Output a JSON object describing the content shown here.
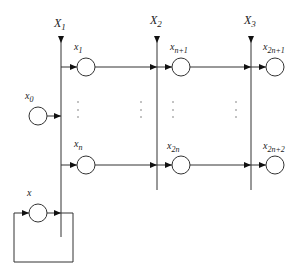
{
  "diagram": {
    "colors": {
      "stroke": "#333333",
      "background": "#ffffff",
      "arrow": "#111111",
      "dots": "#777777"
    },
    "buses": [
      {
        "id": "X1",
        "label": "X",
        "sub": "1",
        "x": 61,
        "y_top": 36,
        "y_bottom": 237
      },
      {
        "id": "X2",
        "label": "X",
        "sub": "2",
        "x": 157,
        "y_top": 36,
        "y_bottom": 190
      },
      {
        "id": "X3",
        "label": "X",
        "sub": "3",
        "x": 251,
        "y_top": 36,
        "y_bottom": 190
      }
    ],
    "nodes": [
      {
        "id": "x1",
        "label": "x",
        "sub": "1",
        "cx": 86,
        "cy": 67
      },
      {
        "id": "xn1",
        "label": "x",
        "sub": "n+1",
        "cx": 181,
        "cy": 67
      },
      {
        "id": "x2n1",
        "label": "x",
        "sub": "2n+1",
        "cx": 275,
        "cy": 67
      },
      {
        "id": "xn",
        "label": "x",
        "sub": "n",
        "cx": 86,
        "cy": 165
      },
      {
        "id": "x2n",
        "label": "x",
        "sub": "2n",
        "cx": 181,
        "cy": 165
      },
      {
        "id": "x2n2",
        "label": "x",
        "sub": "2n+2",
        "cx": 275,
        "cy": 165
      },
      {
        "id": "x0",
        "label": "x",
        "sub": "0",
        "cx": 37,
        "cy": 116
      },
      {
        "id": "x",
        "label": "x",
        "sub": "",
        "cx": 37,
        "cy": 213
      }
    ],
    "labels": {
      "X1": "X",
      "X1_sub": "1",
      "X2": "X",
      "X2_sub": "2",
      "X3": "X",
      "X3_sub": "3",
      "x1": "x",
      "x1_sub": "1",
      "xn1": "x",
      "xn1_sub": "n+1",
      "x2n1": "x",
      "x2n1_sub": "2n+1",
      "xn": "x",
      "xn_sub": "n",
      "x2n": "x",
      "x2n_sub": "2n",
      "x2n2": "x",
      "x2n2_sub": "2n+2",
      "x0": "x",
      "x0_sub": "0",
      "x": "x"
    },
    "ellipsis_columns": [
      75,
      139,
      170,
      235
    ],
    "feedback_loop": {
      "x_left": 14,
      "x_right": 73,
      "y_top": 213,
      "y_bottom": 262
    }
  }
}
